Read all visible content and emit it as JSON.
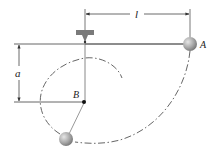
{
  "diagram": {
    "type": "pendulum-with-peg",
    "labels": {
      "length": "l",
      "offset": "a",
      "point_a": "A",
      "point_b": "B"
    },
    "colors": {
      "line": "#555555",
      "support": "#777777",
      "ball": "#9a9a9a",
      "text": "#222222"
    }
  }
}
